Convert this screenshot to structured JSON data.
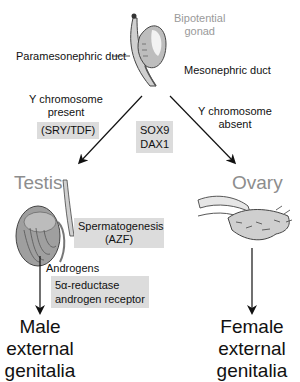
{
  "gonad": {
    "label_line1": "Bipotential",
    "label_line2": "gonad",
    "paramesonephric": "Paramesonephric duct",
    "mesonephric": "Mesonephric duct"
  },
  "left_branch": {
    "condition_line1": "Y chromosome",
    "condition_line2": "present",
    "gene_box": "(SRY/TDF)",
    "organ": "Testis",
    "spermatogenesis_line1": "Spermatogenesis",
    "spermatogenesis_line2": "(AZF)",
    "hormone": "Androgens",
    "factors_line1": "5α-reductase",
    "factors_line2": "androgen receptor",
    "outcome_line1": "Male",
    "outcome_line2": "external",
    "outcome_line3": "genitalia"
  },
  "center": {
    "gene1": "SOX9",
    "gene2": "DAX1"
  },
  "right_branch": {
    "condition_line1": "Y chromosome",
    "condition_line2": "absent",
    "organ": "Ovary",
    "outcome_line1": "Female",
    "outcome_line2": "external",
    "outcome_line3": "genitalia"
  },
  "colors": {
    "box_fill": "#dcdcdc",
    "organ_label": "#8d8d8d",
    "line": "#111111"
  }
}
